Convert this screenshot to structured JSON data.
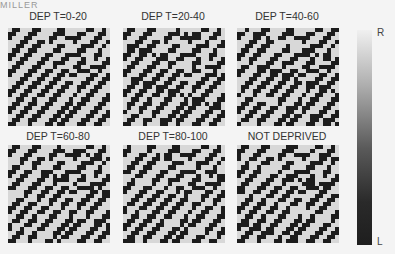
{
  "header": {
    "text": "MILLER"
  },
  "panels": [
    {
      "title": "DEP T=0-20",
      "x": 8,
      "y": 28,
      "tx": 3,
      "ty": 10,
      "variant": 0
    },
    {
      "title": "DEP T=20-40",
      "x": 123,
      "y": 28,
      "tx": 118,
      "ty": 10,
      "variant": 1
    },
    {
      "title": "DEP T=40-60",
      "x": 237,
      "y": 28,
      "tx": 232,
      "ty": 10,
      "variant": 2
    },
    {
      "title": "DEP T=60-80",
      "x": 8,
      "y": 145,
      "tx": 3,
      "ty": 130,
      "variant": 3
    },
    {
      "title": "DEP T=80-100",
      "x": 123,
      "y": 145,
      "tx": 118,
      "ty": 130,
      "variant": 4
    },
    {
      "title": "NOT DEPRIVED",
      "x": 237,
      "y": 145,
      "tx": 232,
      "ty": 130,
      "variant": 5
    }
  ],
  "colorbar": {
    "top_label": "R",
    "bottom_label": "L"
  },
  "pattern": [
    "0110001100001100000110010",
    "1100011000011100011000110",
    "1000110000110011110001100",
    "0001100110100000100011001",
    "0011001100001100001110010",
    "0110011000011000011000100",
    "1100110001100011110001100",
    "1001100011000110001001001",
    "0011000110011100011000011",
    "0110001100010000110011110",
    "1100011001100110011100100",
    "1000110011001101100011001",
    "0001100110011000000110011",
    "0011001100110011001100110",
    "0110011001100110011001100",
    "1100110011001100010011000",
    "1001100110011000100110001",
    "0011001000110001001100011",
    "0110011001100011011000110",
    "1100110011000110110001100",
    "1001100110001101100011001",
    "0011001100011011000110011",
    "0110011000110110001100110",
    "1100010001101100011001100"
  ]
}
